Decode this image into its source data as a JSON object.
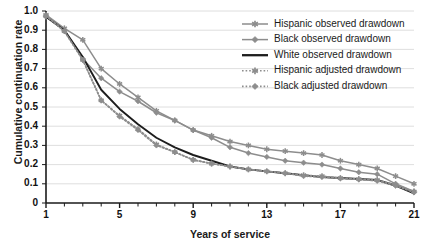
{
  "chart_data": {
    "type": "line",
    "title": "",
    "xlabel": "Years of service",
    "ylabel": "Cumulative continuation rate",
    "xlim": [
      1,
      21
    ],
    "ylim": [
      0,
      1.0
    ],
    "grid": "horizontal",
    "legend_position": "top-right",
    "x": [
      1,
      2,
      3,
      4,
      5,
      6,
      7,
      8,
      9,
      10,
      11,
      12,
      13,
      14,
      15,
      16,
      17,
      18,
      19,
      20,
      21
    ],
    "xticklabels": [
      "1",
      "5",
      "9",
      "13",
      "17",
      "21"
    ],
    "xtickvalues": [
      1,
      5,
      9,
      13,
      17,
      21
    ],
    "yticklabels": [
      "0",
      "0.1",
      "0.2",
      "0.3",
      "0.4",
      "0.5",
      "0.6",
      "0.7",
      "0.8",
      "0.9",
      "1.0"
    ],
    "ytickvalues": [
      0,
      0.1,
      0.2,
      0.3,
      0.4,
      0.5,
      0.6,
      0.7,
      0.8,
      0.9,
      1.0
    ],
    "series": [
      {
        "name": "Hispanic observed drawdown",
        "color": "#8d8d8d",
        "style": "solid",
        "marker": "asterisk",
        "values": [
          0.98,
          0.91,
          0.85,
          0.7,
          0.62,
          0.55,
          0.48,
          0.43,
          0.38,
          0.35,
          0.32,
          0.3,
          0.28,
          0.27,
          0.26,
          0.25,
          0.22,
          0.2,
          0.18,
          0.14,
          0.1
        ]
      },
      {
        "name": "Black observed drawdown",
        "color": "#8d8d8d",
        "style": "solid",
        "marker": "diamond",
        "values": [
          0.97,
          0.9,
          0.75,
          0.65,
          0.58,
          0.53,
          0.47,
          0.43,
          0.38,
          0.34,
          0.29,
          0.26,
          0.24,
          0.22,
          0.21,
          0.2,
          0.18,
          0.16,
          0.15,
          0.1,
          0.06
        ]
      },
      {
        "name": "White observed drawdown",
        "color": "#1d1d1d",
        "style": "solid",
        "marker": "none",
        "values": [
          0.97,
          0.9,
          0.76,
          0.59,
          0.49,
          0.41,
          0.34,
          0.29,
          0.25,
          0.22,
          0.19,
          0.175,
          0.165,
          0.155,
          0.145,
          0.135,
          0.13,
          0.125,
          0.12,
          0.09,
          0.05
        ]
      },
      {
        "name": "Hispanic adjusted drawdown",
        "color": "#8d8d8d",
        "style": "dotted",
        "marker": "asterisk",
        "values": [
          0.975,
          0.895,
          0.745,
          0.535,
          0.455,
          0.385,
          0.305,
          0.265,
          0.225,
          0.205,
          0.19,
          0.175,
          0.165,
          0.155,
          0.145,
          0.14,
          0.13,
          0.125,
          0.12,
          0.095,
          0.06
        ]
      },
      {
        "name": "Black adjusted drawdown",
        "color": "#8d8d8d",
        "style": "dotted",
        "marker": "diamond",
        "values": [
          0.975,
          0.895,
          0.745,
          0.535,
          0.45,
          0.38,
          0.3,
          0.265,
          0.225,
          0.205,
          0.19,
          0.175,
          0.165,
          0.155,
          0.14,
          0.135,
          0.128,
          0.122,
          0.115,
          0.09,
          0.055
        ]
      }
    ]
  },
  "axes": {
    "ylabel": "Cumulative continuation rate",
    "xlabel": "Years of service",
    "yticks": [
      "1.0",
      "0.9",
      "0.8",
      "0.7",
      "0.6",
      "0.5",
      "0.4",
      "0.3",
      "0.2",
      "0.1",
      "0"
    ],
    "xticks": [
      "1",
      "5",
      "9",
      "13",
      "17",
      "21"
    ]
  },
  "legend": {
    "entries": [
      {
        "label": "Hispanic observed drawdown"
      },
      {
        "label": "Black observed drawdown"
      },
      {
        "label": "White observed drawdown"
      },
      {
        "label": "Hispanic adjusted drawdown"
      },
      {
        "label": "Black adjusted drawdown"
      }
    ]
  }
}
